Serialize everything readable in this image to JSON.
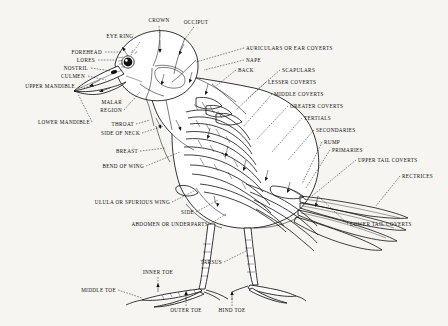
{
  "page": {
    "background_color": "#f6f5f1",
    "ink_color": "#111111"
  },
  "labels": {
    "crown": "CROWN",
    "occiput": "OCCIPUT",
    "eye_ring": "EYE RING",
    "forehead": "FOREHEAD",
    "lores": "LORES",
    "nostril": "NOSTRIL",
    "culmen": "CULMEN",
    "upper_mandible": "UPPER MANDIBLE",
    "lower_mandible": "LOWER MANDIBLE",
    "malar_region_line1": "MALAR",
    "malar_region_line2": "REGION",
    "throat": "THROAT",
    "side_of_neck": "SIDE OF NECK",
    "breast": "BREAST",
    "bend_of_wing": "BEND OF WING",
    "auriculars": "AURICULARS OR EAR COVERTS",
    "nape": "NAPE",
    "back": "BACK",
    "scapulars": "SCAPULARS",
    "lesser_coverts": "LESSER COVERTS",
    "middle_coverts": "MIDDLE COVERTS",
    "greater_coverts": "GREATER COVERTS",
    "tertials": "TERTIALS",
    "secondaries": "SECONDARIES",
    "rump": "RUMP",
    "primaries": "PRIMARIES",
    "upper_tail_coverts": "UPPER TAIL COVERTS",
    "rectrices": "RECTRICES",
    "lower_tail_coverts": "LOWER TAIL COVERTS",
    "ulula": "ULULA OR SPURIOUS WING",
    "side": "SIDE",
    "abdomen": "ABDOMEN OR UNDERPARTS",
    "tarsus": "TARSUS",
    "inner_toe": "INNER TOE",
    "middle_toe": "MIDDLE TOE",
    "outer_toe": "OUTER TOE",
    "hind_toe": "HIND TOE"
  }
}
